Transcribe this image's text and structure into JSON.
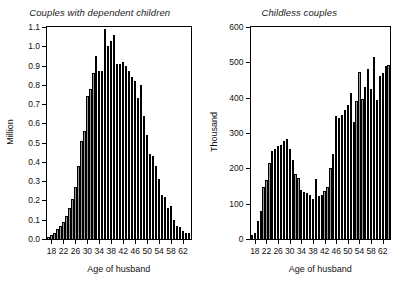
{
  "figure": {
    "background_color": "#ffffff",
    "axis_color": "#000000",
    "bar_fill_dark": "#5c5c5c",
    "bar_fill_light": "#efefef"
  },
  "chart_data": [
    {
      "type": "bar",
      "panel_index": 0,
      "title": "Couples with dependent children",
      "xlabel": "Age of husband",
      "ylabel": "Million",
      "ylim": [
        0.0,
        1.1
      ],
      "xlim": [
        16.5,
        64.5
      ],
      "grid": false,
      "legend": null,
      "ytick_labels": [
        "0.0",
        "0.1",
        "0.2",
        "0.3",
        "0.4",
        "0.5",
        "0.6",
        "0.7",
        "0.8",
        "0.9",
        "1.0",
        "1.1"
      ],
      "ytick_values": [
        0.0,
        0.1,
        0.2,
        0.3,
        0.4,
        0.5,
        0.6,
        0.7,
        0.8,
        0.9,
        1.0,
        1.1
      ],
      "xtick_labels": [
        "18",
        "22",
        "26",
        "30",
        "34",
        "38",
        "42",
        "46",
        "50",
        "54",
        "58",
        "62"
      ],
      "xtick_values": [
        18,
        22,
        26,
        30,
        34,
        38,
        42,
        46,
        50,
        54,
        58,
        62
      ],
      "categories": [
        17,
        18,
        19,
        20,
        21,
        22,
        23,
        24,
        25,
        26,
        27,
        28,
        29,
        30,
        31,
        32,
        33,
        34,
        35,
        36,
        37,
        38,
        39,
        40,
        41,
        42,
        43,
        44,
        45,
        46,
        47,
        48,
        49,
        50,
        51,
        52,
        53,
        54,
        55,
        56,
        57,
        58,
        59,
        60,
        61,
        62,
        63,
        64
      ],
      "values": [
        0.01,
        0.02,
        0.03,
        0.05,
        0.07,
        0.09,
        0.12,
        0.16,
        0.21,
        0.27,
        0.38,
        0.51,
        0.56,
        0.74,
        0.78,
        0.86,
        0.95,
        0.87,
        0.87,
        1.09,
        1.0,
        1.03,
        1.06,
        0.91,
        0.91,
        0.92,
        0.9,
        0.87,
        0.84,
        0.82,
        0.73,
        0.8,
        0.64,
        0.54,
        0.44,
        0.43,
        0.38,
        0.31,
        0.23,
        0.22,
        0.16,
        0.17,
        0.1,
        0.07,
        0.06,
        0.04,
        0.03,
        0.03
      ]
    },
    {
      "type": "bar",
      "panel_index": 1,
      "title": "Childless couples",
      "xlabel": "Age of husband",
      "ylabel": "Thousand",
      "ylim": [
        0,
        600
      ],
      "xlim": [
        16.5,
        64.5
      ],
      "grid": false,
      "legend": null,
      "ytick_labels": [
        "0",
        "100",
        "200",
        "300",
        "400",
        "500",
        "600"
      ],
      "ytick_values": [
        0,
        100,
        200,
        300,
        400,
        500,
        600
      ],
      "xtick_labels": [
        "18",
        "22",
        "26",
        "30",
        "34",
        "38",
        "42",
        "46",
        "50",
        "54",
        "58",
        "62"
      ],
      "xtick_values": [
        18,
        22,
        26,
        30,
        34,
        38,
        42,
        46,
        50,
        54,
        58,
        62
      ],
      "categories": [
        17,
        18,
        19,
        20,
        21,
        22,
        23,
        24,
        25,
        26,
        27,
        28,
        29,
        30,
        31,
        32,
        33,
        34,
        35,
        36,
        37,
        38,
        39,
        40,
        41,
        42,
        43,
        44,
        45,
        46,
        47,
        48,
        49,
        50,
        51,
        52,
        53,
        54,
        55,
        56,
        57,
        58,
        59,
        60,
        61,
        62,
        63,
        64
      ],
      "values": [
        10,
        18,
        52,
        78,
        148,
        168,
        215,
        250,
        256,
        262,
        265,
        277,
        283,
        255,
        223,
        185,
        172,
        140,
        133,
        130,
        124,
        113,
        170,
        121,
        124,
        135,
        146,
        202,
        241,
        348,
        342,
        350,
        365,
        378,
        412,
        330,
        392,
        472,
        396,
        430,
        482,
        425,
        516,
        393,
        460,
        470,
        490,
        492
      ]
    }
  ]
}
